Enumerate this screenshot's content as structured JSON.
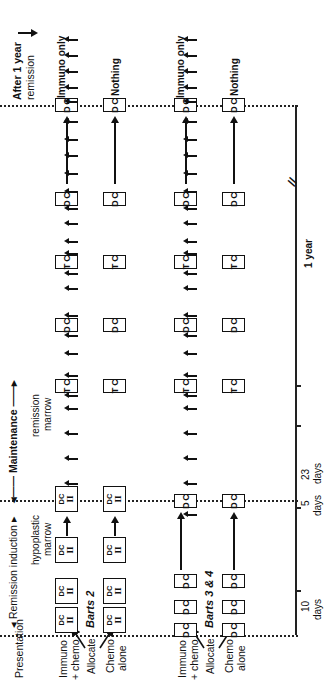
{
  "figure": {
    "orientation": "rotated-90-ccw",
    "phases": {
      "presentation": "Presentation",
      "remission_induction": "Remission induction",
      "maintenance": "Maintenance",
      "after_one_year": "After 1 year remission"
    },
    "marrow_labels": {
      "hypoplastic": "hypoplastic marrow",
      "remission": "remission marrow"
    },
    "trials": [
      {
        "name": "Barts 2",
        "allocate_label": "Allocate",
        "arms": [
          {
            "label": "Immuno + chemo",
            "after_label": "Immuno only"
          },
          {
            "label": "Chemo alone",
            "after_label": "Nothing"
          }
        ],
        "induction_boxes": [
          "DC/II",
          "DC/II",
          "DC/II",
          "DC/II"
        ]
      },
      {
        "name": "Barts 3 & 4",
        "allocate_label": "Allocate",
        "arms": [
          {
            "label": "Immuno + chemo",
            "after_label": "Immuno only"
          },
          {
            "label": "Chemo alone",
            "after_label": "Nothing"
          }
        ],
        "induction_boxes": [
          "DC",
          "DC",
          "DC",
          "DC"
        ]
      }
    ],
    "maintenance_boxes": [
      "TC",
      "DC",
      "TC",
      "DC",
      "DC"
    ],
    "timeline": {
      "labels": [
        "10 days",
        "5 days",
        "23 days",
        "1 year"
      ],
      "break_symbol": "//"
    }
  },
  "text": {
    "presentation": "Presentation",
    "induction": "◂ Remission induction ▸",
    "maintenance": "◂—— Maintenance ——▸",
    "after1": "After 1 year",
    "after2": "remission",
    "hypo1": "hypoplastic",
    "hypo2": "marrow",
    "remis1": "remission",
    "remis2": "marrow",
    "allocate": "Allocate",
    "immuno1": "Immuno",
    "immuno2": "+ chemo",
    "chemo1": "Chemo",
    "chemo2": "alone",
    "barts2": "Barts 2",
    "barts34": "Barts 3 & 4",
    "immuno_only": "Immuno only",
    "nothing": "Nothing",
    "d10a": "10",
    "d10b": "days",
    "d5a": "5",
    "d5b": "days",
    "d23a": "23",
    "d23b": "days",
    "year1": "1 year",
    "brk": "//",
    "D": "D",
    "C": "C",
    "T": "T",
    "DC": "DC",
    "II": "II"
  }
}
